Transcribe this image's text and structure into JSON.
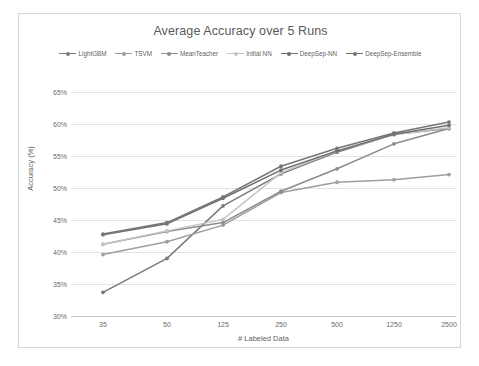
{
  "chart_data": {
    "type": "line",
    "title": "Average Accuracy over 5 Runs",
    "xlabel": "# Labeled Data",
    "ylabel": "Accuracy (%)",
    "categories": [
      "35",
      "50",
      "125",
      "250",
      "500",
      "1250",
      "2500"
    ],
    "ytick_labels": [
      "65%",
      "60%",
      "55%",
      "50%",
      "45%",
      "40%",
      "35%",
      "30%"
    ],
    "ylim": [
      30,
      65
    ],
    "ytick_step": 5,
    "grid": true,
    "legend_position": "top",
    "series": [
      {
        "name": "LightGBM",
        "color": "#7a7a7a",
        "values": [
          33.7,
          39.0,
          47.2,
          52.2,
          55.6,
          58.4,
          59.3
        ]
      },
      {
        "name": "TSVM",
        "color": "#9e9e9e",
        "values": [
          39.6,
          41.6,
          44.2,
          49.3,
          50.9,
          51.3,
          52.1
        ]
      },
      {
        "name": "MeanTeacher",
        "color": "#8c8c8c",
        "values": [
          41.2,
          43.2,
          44.6,
          49.5,
          53.0,
          56.9,
          59.3
        ]
      },
      {
        "name": "Initial NN",
        "color": "#c4c4c4",
        "values": [
          41.2,
          43.3,
          45.1,
          52.4,
          55.8,
          58.3,
          59.4
        ]
      },
      {
        "name": "DeepSep-NN",
        "color": "#6e6e6e",
        "values": [
          42.7,
          44.4,
          48.4,
          52.8,
          55.8,
          58.4,
          59.8
        ]
      },
      {
        "name": "DeepSep-Ensemble",
        "color": "#767676",
        "values": [
          42.8,
          44.6,
          48.6,
          53.4,
          56.2,
          58.6,
          60.3
        ]
      }
    ]
  }
}
